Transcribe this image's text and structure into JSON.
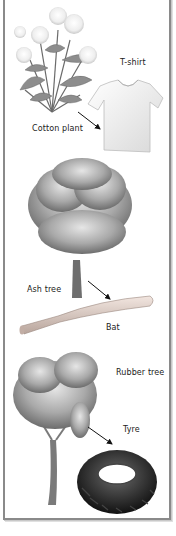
{
  "diagram": {
    "title": "",
    "panels": [
      {
        "source": "Cotton plant",
        "product": "T-shirt"
      },
      {
        "source": "Ash tree",
        "product": "Bat"
      },
      {
        "source": "Rubber tree",
        "product": "Tyre"
      }
    ],
    "colors": {
      "frame": "#8a8a8a",
      "ink": "#222222",
      "background": "#ffffff"
    }
  }
}
